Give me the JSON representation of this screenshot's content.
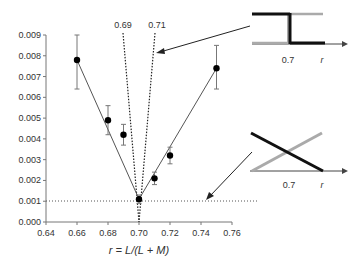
{
  "chart_data": {
    "type": "scatter",
    "title": "",
    "xlabel": "r = L/(L + M)",
    "ylabel": "",
    "xlim": [
      0.64,
      0.76
    ],
    "ylim": [
      0.0,
      0.009
    ],
    "grid": false,
    "x_ticks": [
      "0.64",
      "0.66",
      "0.68",
      "0.70",
      "0.72",
      "0.74",
      "0.76"
    ],
    "y_ticks": [
      "0.000",
      "0.001",
      "0.002",
      "0.003",
      "0.004",
      "0.005",
      "0.006",
      "0.007",
      "0.008",
      "0.009"
    ],
    "series": [
      {
        "name": "measured",
        "x": [
          0.66,
          0.68,
          0.69,
          0.7,
          0.71,
          0.72,
          0.75
        ],
        "y": [
          0.0078,
          0.0049,
          0.0042,
          0.0011,
          0.0021,
          0.0032,
          0.0074
        ],
        "error_low": [
          0.0064,
          0.0042,
          0.0037,
          0.0009,
          0.0018,
          0.0028,
          0.0064
        ],
        "error_high": [
          0.009,
          0.0056,
          0.0047,
          0.0013,
          0.0024,
          0.0036,
          0.0085
        ]
      }
    ],
    "fit_lines": [
      {
        "name": "left-fit",
        "x": [
          0.66,
          0.7
        ],
        "y": [
          0.0078,
          0.0011
        ]
      },
      {
        "name": "right-fit",
        "x": [
          0.7,
          0.75
        ],
        "y": [
          0.0011,
          0.0074
        ]
      }
    ],
    "reference_lines": [
      {
        "type": "dotted-vertical-fan",
        "label": "0.69",
        "x_top": 0.69
      },
      {
        "type": "dotted-vertical-fan",
        "label": "0.71",
        "x_top": 0.71
      },
      {
        "type": "dotted-horizontal",
        "y": 0.001
      }
    ],
    "annotations": [
      {
        "label": "0.69"
      },
      {
        "label": "0.71"
      }
    ],
    "insets": [
      {
        "name": "step-model",
        "tick_label": "0.7",
        "axis_label": "r",
        "description": "Step function: black high then drops at 0.7; gray low then rises at 0.7"
      },
      {
        "name": "linear-model",
        "tick_label": "0.7",
        "axis_label": "r",
        "description": "Linear crossing: black descending, gray ascending, crossing near 0.7"
      }
    ]
  },
  "labels": {
    "xlabel": "r = L/(L + M)",
    "fan_left": "0.69",
    "fan_right": "0.71",
    "inset1_tick": "0.7",
    "inset1_axis": "r",
    "inset2_tick": "0.7",
    "inset2_axis": "r"
  }
}
